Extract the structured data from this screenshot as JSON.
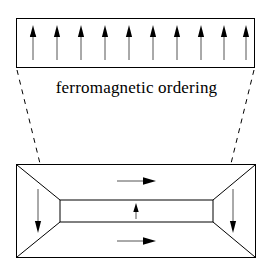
{
  "figure": {
    "title_caption": "ferromagnetic ordering",
    "background_color": "#ffffff",
    "stroke_color": "#000000",
    "arrow_color": "#000000",
    "dashed_color": "#000000"
  },
  "top_strip": {
    "name": "magnified-ferromagnetic-strip",
    "rect": {
      "x": 16,
      "y": 18,
      "width": 239,
      "height": 50
    },
    "arrow_count": 10,
    "arrow_direction": "up",
    "arrow_x_positions": [
      33,
      57,
      81,
      105,
      129,
      153,
      177,
      201,
      225,
      247
    ],
    "arrow_top_y": 26,
    "arrow_bottom_y": 60
  },
  "leaders": {
    "name": "magnification-leader-lines",
    "style": "dashed",
    "left_line": {
      "x1": 17,
      "y1": 70,
      "x2": 47,
      "y2": 192
    },
    "right_line": {
      "x1": 254,
      "y1": 70,
      "x2": 224,
      "y2": 192
    }
  },
  "domain_block": {
    "name": "magnetic-domain-block",
    "outer_rect": {
      "x": 16,
      "y": 164,
      "width": 240,
      "height": 94
    },
    "center_band": {
      "x": 60,
      "y": 200,
      "width": 153,
      "height": 22
    },
    "closure_domains": [
      {
        "name": "left-closure-domain",
        "label": "down"
      },
      {
        "name": "right-closure-domain",
        "label": "down"
      }
    ],
    "arrows": [
      {
        "name": "left-domain-arrow",
        "direction": "down",
        "x": 38,
        "y1": 190,
        "y2": 232
      },
      {
        "name": "right-domain-arrow",
        "direction": "down",
        "x": 233,
        "y1": 190,
        "y2": 232
      },
      {
        "name": "upper-domain-arrow",
        "direction": "right",
        "y": 181,
        "x1": 117,
        "x2": 155
      },
      {
        "name": "center-band-arrow",
        "direction": "up",
        "x": 136,
        "y1": 205,
        "y2": 219
      },
      {
        "name": "lower-domain-arrow",
        "direction": "right",
        "y": 241,
        "x1": 117,
        "x2": 155
      }
    ]
  }
}
